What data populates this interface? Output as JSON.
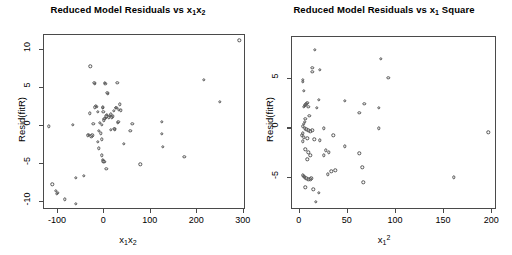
{
  "figure": {
    "width": 512,
    "height": 255,
    "background": "#ffffff",
    "foreground": "#000000",
    "point_color": "#555555",
    "axis_color": "#4a4a4a"
  },
  "chart_data": [
    {
      "type": "scatter",
      "panel": "left",
      "title": "Reduced Model Residuals vs x₁x₂",
      "title_parts": {
        "prefix": "Reduced Model Residuals vs ",
        "var": "x",
        "sub1": "1",
        "var2": "x",
        "sub2": "2"
      },
      "xlabel": "x₁x₂",
      "ylabel": "Resid(fitR)",
      "xlim": [
        -130,
        305
      ],
      "ylim": [
        -11,
        12
      ],
      "xticks": [
        -100,
        0,
        100,
        200,
        300
      ],
      "yticks": [
        10,
        5,
        0,
        -5,
        -10
      ],
      "xticklabels": [
        "-100",
        "0",
        "100",
        "200",
        "300"
      ],
      "yticklabels": [
        "10",
        "5",
        "0",
        "-5",
        "-10"
      ],
      "grid": false,
      "legend": null,
      "marker": "open-circle",
      "points": [
        [
          291,
          11.3
        ],
        [
          214,
          6.1
        ],
        [
          249,
          3.2
        ],
        [
          124,
          0.6
        ],
        [
          124,
          -1.0
        ],
        [
          126,
          -2.7
        ],
        [
          172,
          -4.0
        ],
        [
          77,
          -5.0
        ],
        [
          60,
          0.3
        ],
        [
          56,
          -0.6
        ],
        [
          36,
          2.1
        ],
        [
          33,
          2.9
        ],
        [
          31,
          2.2
        ],
        [
          30,
          0.6
        ],
        [
          29,
          0.5
        ],
        [
          28,
          5.7
        ],
        [
          26,
          2.4
        ],
        [
          24,
          2.4
        ],
        [
          22,
          -0.4
        ],
        [
          21,
          -0.3
        ],
        [
          18,
          1.3
        ],
        [
          16,
          1.2
        ],
        [
          14,
          1.6
        ],
        [
          12,
          1.4
        ],
        [
          10,
          1.2
        ],
        [
          8,
          4.3
        ],
        [
          6,
          4.4
        ],
        [
          5,
          1.5
        ],
        [
          4,
          1.3
        ],
        [
          3,
          1.1
        ],
        [
          2,
          5.6
        ],
        [
          1,
          5.7
        ],
        [
          0,
          1.0
        ],
        [
          -1,
          0.8
        ],
        [
          -2,
          1.9
        ],
        [
          -3,
          2.5
        ],
        [
          -4,
          2.4
        ],
        [
          -5,
          -1.7
        ],
        [
          -6,
          0.2
        ],
        [
          -8,
          -0.9
        ],
        [
          -10,
          0.5
        ],
        [
          -12,
          -0.6
        ],
        [
          -14,
          1.9
        ],
        [
          -16,
          2.6
        ],
        [
          -18,
          2.7
        ],
        [
          -20,
          5.6
        ],
        [
          -22,
          5.7
        ],
        [
          -24,
          0.3
        ],
        [
          -26,
          -1.2
        ],
        [
          -28,
          -1.3
        ],
        [
          -30,
          7.9
        ],
        [
          -32,
          1.7
        ],
        [
          -34,
          -1.1
        ],
        [
          -36,
          -1.2
        ],
        [
          -12,
          -2.9
        ],
        [
          -6,
          -3.8
        ],
        [
          -4,
          -4.4
        ],
        [
          -2,
          -4.6
        ],
        [
          0,
          -4.7
        ],
        [
          4,
          -5.6
        ],
        [
          -14,
          -2.0
        ],
        [
          -44,
          -6.5
        ],
        [
          -62,
          -6.8
        ],
        [
          -68,
          0.2
        ],
        [
          -85,
          -9.6
        ],
        [
          -100,
          -8.7
        ],
        [
          -102,
          -8.9
        ],
        [
          -105,
          -8.5
        ],
        [
          -112,
          -7.6
        ],
        [
          -120,
          0.0
        ],
        [
          -62,
          -10.2
        ],
        [
          42,
          -2.3
        ],
        [
          20,
          2.0
        ],
        [
          14,
          -0.5
        ],
        [
          -20,
          2.5
        ]
      ]
    },
    {
      "type": "scatter",
      "panel": "right",
      "title": "Reduced Model Residuals vs x₁ Square",
      "title_parts": {
        "prefix": "Reduced Model Residuals vs ",
        "var": "x",
        "sub1": "1",
        "suffix": " Square"
      },
      "xlabel": "x₁²",
      "ylabel": "Resid(fitR)",
      "xlim": [
        -8,
        205
      ],
      "ylim": [
        -8.2,
        9.2
      ],
      "xticks": [
        0,
        50,
        100,
        150,
        200
      ],
      "yticks": [
        5,
        0,
        -5
      ],
      "xticklabels": [
        "0",
        "50",
        "100",
        "150",
        "200"
      ],
      "yticklabels": [
        "5",
        "0",
        "-5"
      ],
      "grid": false,
      "legend": null,
      "marker": "open-circle",
      "points": [
        [
          16,
          7.9
        ],
        [
          84,
          7.0
        ],
        [
          13,
          6.1
        ],
        [
          13,
          5.7
        ],
        [
          21,
          5.9
        ],
        [
          92,
          5.1
        ],
        [
          3,
          4.9
        ],
        [
          3,
          4.7
        ],
        [
          4,
          3.8
        ],
        [
          20,
          2.9
        ],
        [
          47,
          2.8
        ],
        [
          8,
          2.6
        ],
        [
          7,
          2.5
        ],
        [
          6,
          2.4
        ],
        [
          9,
          2.2
        ],
        [
          5,
          2.3
        ],
        [
          4,
          2.2
        ],
        [
          67,
          2.5
        ],
        [
          82,
          2.1
        ],
        [
          62,
          1.6
        ],
        [
          18,
          2.1
        ],
        [
          10,
          1.3
        ],
        [
          6,
          1.0
        ],
        [
          5,
          0.7
        ],
        [
          4,
          0.5
        ],
        [
          3,
          0.2
        ],
        [
          5,
          0.0
        ],
        [
          7,
          -0.1
        ],
        [
          9,
          -0.2
        ],
        [
          11,
          -0.3
        ],
        [
          13,
          -0.2
        ],
        [
          25,
          0.0
        ],
        [
          35,
          -0.7
        ],
        [
          82,
          0.0
        ],
        [
          196,
          -0.4
        ],
        [
          3,
          -0.5
        ],
        [
          2,
          -0.7
        ],
        [
          4,
          -0.9
        ],
        [
          8,
          -1.0
        ],
        [
          15,
          -1.1
        ],
        [
          21,
          -1.2
        ],
        [
          3,
          -1.3
        ],
        [
          47,
          -1.8
        ],
        [
          6,
          -2.1
        ],
        [
          9,
          -2.4
        ],
        [
          27,
          -2.2
        ],
        [
          30,
          -2.4
        ],
        [
          62,
          -2.5
        ],
        [
          8,
          -3.1
        ],
        [
          11,
          -2.7
        ],
        [
          25,
          -2.7
        ],
        [
          33,
          -4.3
        ],
        [
          37,
          -4.2
        ],
        [
          29,
          -4.6
        ],
        [
          65,
          -3.9
        ],
        [
          3,
          -4.7
        ],
        [
          4,
          -4.8
        ],
        [
          7,
          -5.0
        ],
        [
          9,
          -5.1
        ],
        [
          11,
          -5.1
        ],
        [
          66,
          -5.4
        ],
        [
          160,
          -4.9
        ],
        [
          6,
          -5.9
        ],
        [
          14,
          -6.1
        ],
        [
          20,
          -6.5
        ],
        [
          17,
          -7.4
        ],
        [
          5,
          -4.9
        ],
        [
          12,
          -5.0
        ]
      ]
    }
  ]
}
